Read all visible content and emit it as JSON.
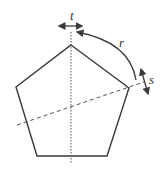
{
  "diagram": {
    "title": "",
    "labels": {
      "t": "t",
      "r": "r",
      "s": "s"
    },
    "colors": {
      "stroke": "#3a3a3a",
      "background": "#ffffff"
    },
    "shape": "regular pentagon",
    "annotations": [
      {
        "id": "t",
        "meaning": "horizontal translation arrow at top of vertical axis"
      },
      {
        "id": "r",
        "meaning": "curved rotation arrow from right vertex to top"
      },
      {
        "id": "s",
        "meaning": "diagonal slide arrow at right vertex"
      }
    ]
  }
}
